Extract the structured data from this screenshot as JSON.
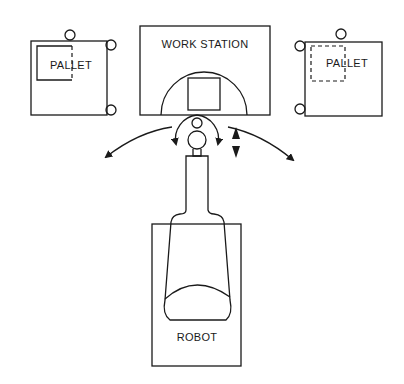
{
  "diagram": {
    "labels": {
      "left_pallet": "PALLET",
      "workstation": "WORK STATION",
      "right_pallet": "PALLET",
      "robot": "ROBOT"
    },
    "colors": {
      "ink": "#1a1a1a",
      "background": "#ffffff"
    },
    "motions": [
      "swing-left",
      "rotate-left",
      "rotate-right",
      "vertical-up-down",
      "swing-right"
    ]
  }
}
